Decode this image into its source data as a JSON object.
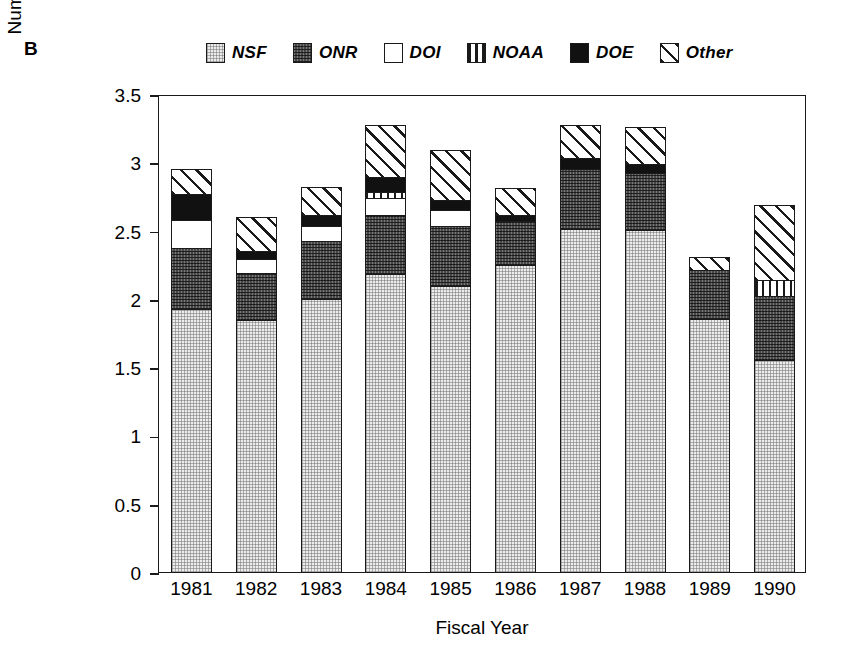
{
  "panel": {
    "label": "B"
  },
  "legend": {
    "items": [
      {
        "label": "NSF",
        "pattern": "light-gray-stipple",
        "color": "#ececec"
      },
      {
        "label": "ONR",
        "pattern": "dark-gray-stipple",
        "color": "#474747"
      },
      {
        "label": "DOI",
        "pattern": "white",
        "color": "#ffffff"
      },
      {
        "label": "NOAA",
        "pattern": "vertical-stripes",
        "color": "#ffffff"
      },
      {
        "label": "DOE",
        "pattern": "solid-black",
        "color": "#111111"
      },
      {
        "label": "Other",
        "pattern": "diagonal-hatch",
        "color": "#ffffff"
      }
    ]
  },
  "chart_data": {
    "type": "bar",
    "title": "",
    "subtitle": "",
    "stacked": true,
    "xlabel": "Fiscal Year",
    "ylabel": "Number of Operational Days (thousands)",
    "ylabel_lines": [
      "Number of Operational Days",
      "(thousands)"
    ],
    "categories": [
      "1981",
      "1982",
      "1983",
      "1984",
      "1985",
      "1986",
      "1987",
      "1988",
      "1989",
      "1990"
    ],
    "ylim": [
      0,
      3.5
    ],
    "yticks": [
      0,
      0.5,
      1,
      1.5,
      2,
      2.5,
      3,
      3.5
    ],
    "ytick_labels": [
      "0",
      "0.5",
      "1",
      "1.5",
      "2",
      "2.5",
      "3",
      "3.5"
    ],
    "grid": false,
    "legend_position": "top",
    "series": [
      {
        "name": "NSF",
        "values": [
          1.92,
          1.84,
          2.0,
          2.18,
          2.09,
          2.25,
          2.51,
          2.5,
          1.85,
          1.55
        ]
      },
      {
        "name": "ONR",
        "values": [
          0.45,
          0.35,
          0.42,
          0.43,
          0.44,
          0.32,
          0.44,
          0.42,
          0.36,
          0.47
        ]
      },
      {
        "name": "DOI",
        "values": [
          0.21,
          0.1,
          0.11,
          0.13,
          0.12,
          0.0,
          0.0,
          0.0,
          0.0,
          0.0
        ]
      },
      {
        "name": "NOAA",
        "values": [
          0.0,
          0.0,
          0.0,
          0.04,
          0.0,
          0.0,
          0.0,
          0.0,
          0.0,
          0.12
        ]
      },
      {
        "name": "DOE",
        "values": [
          0.19,
          0.06,
          0.08,
          0.11,
          0.07,
          0.04,
          0.08,
          0.07,
          0.0,
          0.0
        ]
      },
      {
        "name": "Other",
        "values": [
          0.18,
          0.25,
          0.21,
          0.38,
          0.37,
          0.2,
          0.24,
          0.27,
          0.1,
          0.55
        ]
      }
    ],
    "totals": [
      2.95,
      2.6,
      2.82,
      3.27,
      3.09,
      2.81,
      3.27,
      3.26,
      2.31,
      2.69
    ]
  }
}
